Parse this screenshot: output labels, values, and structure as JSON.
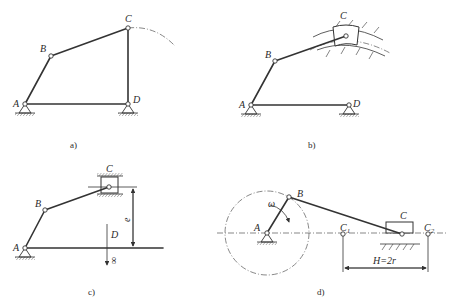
{
  "figure": {
    "panels": [
      {
        "id": "a",
        "caption": "a)",
        "type": "crank-rocker four-bar linkage",
        "labels": {
          "A": "A",
          "B": "B",
          "C": "C",
          "D": "D"
        }
      },
      {
        "id": "b",
        "caption": "b)",
        "type": "four-bar linkage with curved slider guide",
        "labels": {
          "A": "A",
          "B": "B",
          "C": "C",
          "D": "D"
        }
      },
      {
        "id": "c",
        "caption": "c)",
        "type": "offset slider-crank (rocker at infinity)",
        "labels": {
          "A": "A",
          "B": "B",
          "C": "C",
          "D": "D",
          "e": "e",
          "infinity": "∞"
        }
      },
      {
        "id": "d",
        "caption": "d)",
        "type": "centric slider-crank mechanism",
        "labels": {
          "A": "A",
          "B": "B",
          "C": "C",
          "C1": "C",
          "C1_sub": "1",
          "C2": "C",
          "C2_sub": "2",
          "omega": "ω",
          "stroke": "H=2r"
        }
      }
    ]
  }
}
